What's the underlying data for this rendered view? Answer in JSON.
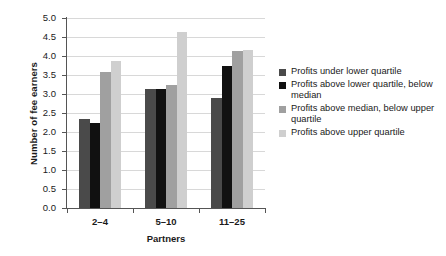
{
  "chart_data": {
    "type": "bar",
    "title": "",
    "subtitle": "",
    "xlabel": "Partners",
    "ylabel": "Number of fee earners",
    "categories": [
      "2–4",
      "5–10",
      "11–25"
    ],
    "series": [
      {
        "name": "Profits under lower quartile",
        "color": "#4a4a4a",
        "values": [
          2.33,
          3.12,
          2.89
        ]
      },
      {
        "name": "Profits above lower quartile, below median",
        "color": "#111111",
        "values": [
          2.23,
          3.12,
          3.75
        ]
      },
      {
        "name": "Profits above median, below upper quartile",
        "color": "#a0a0a0",
        "values": [
          3.58,
          3.25,
          4.13
        ]
      },
      {
        "name": "Profits above upper quartile",
        "color": "#cfcfcf",
        "values": [
          3.87,
          4.62,
          4.15
        ]
      }
    ],
    "ylim": [
      0.0,
      5.0
    ],
    "ytick_labels": [
      "5.0",
      "4.5",
      "4.0",
      "3.5",
      "3.0",
      "2.5",
      "2.0",
      "1.5",
      "1.0",
      "0.5",
      "0.0"
    ],
    "ytick_values": [
      5.0,
      4.5,
      4.0,
      3.5,
      3.0,
      2.5,
      2.0,
      1.5,
      1.0,
      0.5,
      0.0
    ],
    "grid": true,
    "grid_color": "#d8d8d8",
    "legend_position": "right",
    "background_color": "#ffffff",
    "axis_color": "#555555"
  },
  "legend": {
    "entries": [
      {
        "label": "Profits under lower quartile",
        "color": "#4a4a4a"
      },
      {
        "label": "Profits above lower quartile, below median",
        "color": "#111111"
      },
      {
        "label": "Profits above median, below upper quartile",
        "color": "#a0a0a0"
      },
      {
        "label": "Profits above upper quartile",
        "color": "#cfcfcf"
      }
    ]
  }
}
